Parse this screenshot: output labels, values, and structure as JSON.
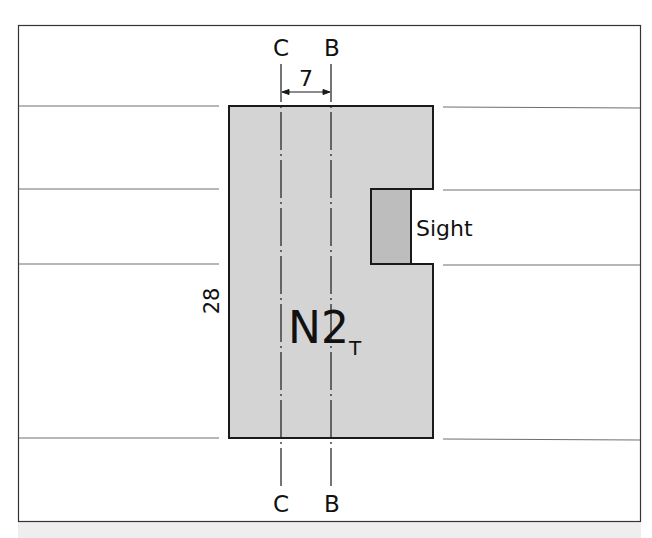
{
  "diagram": {
    "section_lines": {
      "top": {
        "left_label": "C",
        "right_label": "B"
      },
      "bottom": {
        "left_label": "C",
        "right_label": "B"
      }
    },
    "dimension_width": {
      "value": "7"
    },
    "dimension_height": {
      "value": "28"
    },
    "main_block": {
      "label_main": "N2",
      "label_subscript": "T"
    },
    "sight": {
      "label": "Sight"
    },
    "colors": {
      "block_fill": "#d4d4d4",
      "sight_fill": "#bdbdbd",
      "outline": "#1a1a1a",
      "rule_lines": "#6e6e6e",
      "frame": "#333333",
      "bottom_strip": "#eeeeee"
    }
  }
}
